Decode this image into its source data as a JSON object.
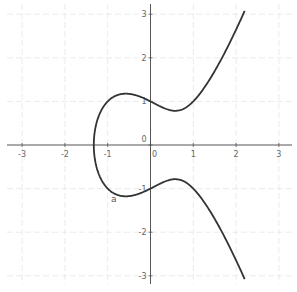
{
  "chart_data": {
    "type": "line",
    "title": "",
    "equation": "y^2 = x^3 - x + 1",
    "xlabel": "",
    "ylabel": "",
    "xlim": [
      -3.3,
      3.3
    ],
    "ylim": [
      -3.2,
      3.2
    ],
    "grid": true,
    "x_ticks": [
      -3,
      -2,
      -1,
      0,
      1,
      2,
      3
    ],
    "y_ticks": [
      -3,
      -2,
      -1,
      0,
      1,
      2,
      3
    ],
    "x_tick_labels": [
      "-3",
      "-2",
      "-1",
      "0",
      "1",
      "2",
      "3"
    ],
    "y_tick_labels": [
      "-3",
      "-2",
      "-1",
      "0",
      "1",
      "2",
      "3"
    ],
    "origin_label": "0",
    "series": [
      {
        "name": "a",
        "color": "#333333",
        "x_range": [
          -1.3247,
          2.2
        ],
        "key_points": [
          {
            "x": -1.3247,
            "y": 0
          },
          {
            "x": -0.577,
            "y": 1.179
          },
          {
            "x": -0.577,
            "y": -1.179
          },
          {
            "x": 0,
            "y": 1
          },
          {
            "x": 0,
            "y": -1
          },
          {
            "x": 0.577,
            "y": 0.784
          },
          {
            "x": 0.577,
            "y": -0.784
          },
          {
            "x": 1,
            "y": 1
          },
          {
            "x": 1,
            "y": -1
          },
          {
            "x": 1.5,
            "y": 1.696
          },
          {
            "x": 1.5,
            "y": -1.696
          },
          {
            "x": 2,
            "y": 2.646
          },
          {
            "x": 2,
            "y": -2.646
          },
          {
            "x": 2.2,
            "y": 3.009
          },
          {
            "x": 2.2,
            "y": -3.009
          }
        ]
      }
    ],
    "legend": []
  },
  "plot": {
    "curve_label": "a",
    "axis_color": "#555555",
    "grid_color": "#e6e6e6",
    "curve_color": "#333333"
  }
}
